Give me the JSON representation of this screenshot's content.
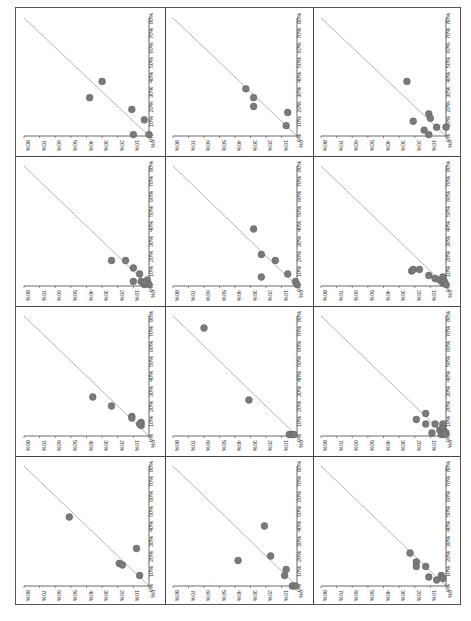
{
  "page": {
    "orientation": "rotated-90",
    "grid": {
      "rows": 4,
      "cols": 3
    }
  },
  "style": {
    "point_color": "#7a7a7a",
    "point_stroke": "#5e5e5e",
    "diagonal_color": "#b5b5b5",
    "axis_color": "#444444",
    "label_color": "#333333",
    "border_color": "#444444"
  },
  "chart_data": [
    {
      "type": "scatter",
      "panel": "r0c0",
      "x_ticks": [
        "0%",
        "10%",
        "20%",
        "30%",
        "40%",
        "50%",
        "60%",
        "70%",
        "80%"
      ],
      "y_ticks": [
        "0%",
        "10%",
        "20%",
        "30%",
        "40%",
        "50%",
        "60%",
        "70%",
        "80%"
      ],
      "xlim": [
        0,
        80
      ],
      "ylim": [
        0,
        80
      ],
      "reference_line": "y=x",
      "points": [
        [
          30,
          37
        ],
        [
          38,
          26
        ],
        [
          11,
          18
        ],
        [
          3,
          11
        ],
        [
          10,
          1
        ],
        [
          0,
          1
        ]
      ]
    },
    {
      "type": "scatter",
      "panel": "r0c1",
      "x_ticks": [
        "0%",
        "10%",
        "20%",
        "30%",
        "40%",
        "50%",
        "60%",
        "70%",
        "80%"
      ],
      "y_ticks": [
        "0%",
        "10%",
        "20%",
        "30%",
        "40%",
        "50%",
        "60%",
        "70%",
        "80%"
      ],
      "xlim": [
        0,
        80
      ],
      "ylim": [
        0,
        80
      ],
      "reference_line": "y=x",
      "points": [
        [
          33,
          32
        ],
        [
          28,
          26
        ],
        [
          28,
          20
        ],
        [
          6,
          16
        ],
        [
          7,
          7
        ]
      ]
    },
    {
      "type": "scatter",
      "panel": "r0c2",
      "x_ticks": [
        "0%",
        "10%",
        "20%",
        "30%",
        "40%",
        "50%",
        "60%",
        "70%",
        "80%"
      ],
      "y_ticks": [
        "0%",
        "10%",
        "20%",
        "30%",
        "40%",
        "50%",
        "60%",
        "70%",
        "80%"
      ],
      "xlim": [
        0,
        80
      ],
      "ylim": [
        0,
        80
      ],
      "reference_line": "y=x",
      "points": [
        [
          25,
          37
        ],
        [
          21,
          10
        ],
        [
          11,
          15
        ],
        [
          10,
          12
        ],
        [
          14,
          4
        ],
        [
          11,
          1
        ],
        [
          6,
          6
        ],
        [
          0,
          6
        ]
      ]
    },
    {
      "type": "scatter",
      "panel": "r1c0",
      "x_ticks": [
        "0%",
        "10%",
        "20%",
        "30%",
        "40%",
        "50%",
        "60%",
        "70%",
        "80%"
      ],
      "y_ticks": [
        "0%",
        "10%",
        "20%",
        "30%",
        "40%",
        "50%",
        "60%",
        "70%",
        "80%"
      ],
      "xlim": [
        0,
        80
      ],
      "ylim": [
        0,
        80
      ],
      "reference_line": "y=x",
      "points": [
        [
          24,
          17
        ],
        [
          15,
          17
        ],
        [
          10,
          12
        ],
        [
          6,
          8
        ],
        [
          10,
          3
        ],
        [
          5,
          3
        ],
        [
          3,
          1
        ],
        [
          1,
          4
        ],
        [
          0,
          1
        ],
        [
          3,
          2
        ]
      ]
    },
    {
      "type": "scatter",
      "panel": "r1c1",
      "x_ticks": [
        "0%",
        "10%",
        "20%",
        "30%",
        "40%",
        "50%",
        "60%",
        "70%",
        "80%"
      ],
      "y_ticks": [
        "0%",
        "10%",
        "20%",
        "30%",
        "40%",
        "50%",
        "60%",
        "70%",
        "80%"
      ],
      "xlim": [
        0,
        80
      ],
      "ylim": [
        0,
        80
      ],
      "reference_line": "y=x",
      "points": [
        [
          28,
          38
        ],
        [
          23,
          21
        ],
        [
          14,
          17
        ],
        [
          23,
          6
        ],
        [
          6,
          8
        ],
        [
          1,
          3
        ],
        [
          0,
          1
        ]
      ]
    },
    {
      "type": "scatter",
      "panel": "r1c2",
      "x_ticks": [
        "0%",
        "10%",
        "20%",
        "30%",
        "40%",
        "50%",
        "60%",
        "70%",
        "80%"
      ],
      "y_ticks": [
        "0%",
        "10%",
        "20%",
        "30%",
        "40%",
        "50%",
        "60%",
        "70%",
        "80%"
      ],
      "xlim": [
        0,
        80
      ],
      "ylim": [
        0,
        80
      ],
      "reference_line": "y=x",
      "points": [
        [
          22,
          10
        ],
        [
          21,
          11
        ],
        [
          17,
          11
        ],
        [
          11,
          7
        ],
        [
          7,
          5
        ],
        [
          4,
          4
        ],
        [
          2,
          6
        ],
        [
          2,
          2
        ],
        [
          1,
          3
        ],
        [
          0,
          1
        ]
      ]
    },
    {
      "type": "scatter",
      "panel": "r2c0",
      "x_ticks": [
        "0%",
        "10%",
        "20%",
        "30%",
        "40%",
        "50%",
        "60%",
        "70%",
        "80%"
      ],
      "y_ticks": [
        "0%",
        "10%",
        "20%",
        "30%",
        "40%",
        "50%",
        "60%",
        "70%",
        "80%"
      ],
      "xlim": [
        0,
        80
      ],
      "ylim": [
        0,
        80
      ],
      "reference_line": "y=x",
      "points": [
        [
          36,
          26
        ],
        [
          24,
          20
        ],
        [
          11,
          13
        ],
        [
          11,
          12
        ],
        [
          5,
          9
        ],
        [
          5,
          7
        ],
        [
          6,
          8
        ]
      ]
    },
    {
      "type": "scatter",
      "panel": "r2c1",
      "x_ticks": [
        "0%",
        "10%",
        "20%",
        "30%",
        "40%",
        "50%",
        "60%",
        "70%",
        "80%"
      ],
      "y_ticks": [
        "0%",
        "10%",
        "20%",
        "30%",
        "40%",
        "50%",
        "60%",
        "70%",
        "80%"
      ],
      "xlim": [
        0,
        80
      ],
      "ylim": [
        0,
        80
      ],
      "reference_line": "y=x",
      "points": [
        [
          60,
          72
        ],
        [
          31,
          24
        ],
        [
          5,
          1
        ],
        [
          3,
          1
        ],
        [
          2,
          1
        ]
      ]
    },
    {
      "type": "scatter",
      "panel": "r2c2",
      "x_ticks": [
        "0%",
        "10%",
        "20%",
        "30%",
        "40%",
        "50%",
        "60%",
        "70%",
        "80%"
      ],
      "y_ticks": [
        "0%",
        "10%",
        "20%",
        "30%",
        "40%",
        "50%",
        "60%",
        "70%",
        "80%"
      ],
      "xlim": [
        0,
        80
      ],
      "ylim": [
        0,
        80
      ],
      "reference_line": "y=x",
      "points": [
        [
          19,
          11
        ],
        [
          13,
          15
        ],
        [
          13,
          8
        ],
        [
          7,
          8
        ],
        [
          9,
          2
        ],
        [
          4,
          4
        ],
        [
          2,
          8
        ],
        [
          2,
          5
        ],
        [
          1,
          3
        ],
        [
          0,
          2
        ],
        [
          3,
          1
        ],
        [
          1,
          1
        ]
      ]
    },
    {
      "type": "scatter",
      "panel": "r3c0",
      "x_ticks": [
        "0%",
        "10%",
        "20%",
        "30%",
        "40%",
        "50%",
        "60%",
        "70%",
        "80%"
      ],
      "y_ticks": [
        "0%",
        "10%",
        "20%",
        "30%",
        "40%",
        "50%",
        "60%",
        "70%",
        "80%"
      ],
      "xlim": [
        0,
        80
      ],
      "ylim": [
        0,
        80
      ],
      "reference_line": "y=x",
      "points": [
        [
          51,
          46
        ],
        [
          8,
          25
        ],
        [
          19,
          15
        ],
        [
          17,
          14
        ],
        [
          6,
          7
        ]
      ]
    },
    {
      "type": "scatter",
      "panel": "r3c1",
      "x_ticks": [
        "0%",
        "10%",
        "20%",
        "30%",
        "40%",
        "50%",
        "60%",
        "70%",
        "80%"
      ],
      "y_ticks": [
        "0%",
        "10%",
        "20%",
        "30%",
        "40%",
        "50%",
        "60%",
        "70%",
        "80%"
      ],
      "xlim": [
        0,
        80
      ],
      "ylim": [
        0,
        80
      ],
      "reference_line": "y=x",
      "points": [
        [
          21,
          40
        ],
        [
          17,
          20
        ],
        [
          38,
          17
        ],
        [
          7,
          11
        ],
        [
          8,
          7
        ],
        [
          3,
          0
        ],
        [
          1,
          0
        ]
      ]
    },
    {
      "type": "scatter",
      "panel": "r3c2",
      "x_ticks": [
        "0%",
        "10%",
        "20%",
        "30%",
        "40%",
        "50%",
        "60%",
        "70%",
        "80%"
      ],
      "y_ticks": [
        "0%",
        "10%",
        "20%",
        "30%",
        "40%",
        "50%",
        "60%",
        "70%",
        "80%"
      ],
      "xlim": [
        0,
        80
      ],
      "ylim": [
        0,
        80
      ],
      "reference_line": "y=x",
      "points": [
        [
          23,
          22
        ],
        [
          19,
          16
        ],
        [
          19,
          13
        ],
        [
          13,
          13
        ],
        [
          11,
          6
        ],
        [
          6,
          4
        ],
        [
          3,
          7
        ],
        [
          2,
          5
        ]
      ]
    }
  ]
}
